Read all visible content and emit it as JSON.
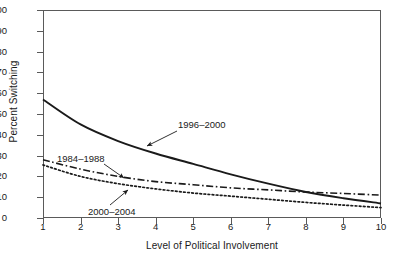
{
  "chart_data": {
    "type": "line",
    "title": "",
    "xlabel": "Level of Political Involvement",
    "ylabel": "Percent Switching",
    "xlim": [
      1,
      10
    ],
    "ylim": [
      0,
      100
    ],
    "xticks": [
      "1",
      "2",
      "3",
      "4",
      "5",
      "6",
      "7",
      "8",
      "9",
      "10"
    ],
    "yticks": [
      "0",
      "10",
      "20",
      "30",
      "40",
      "50",
      "60",
      "70",
      "80",
      "90",
      "100"
    ],
    "grid": false,
    "legend_position": "inline-annotations",
    "x": [
      1,
      2,
      3,
      4,
      5,
      6,
      7,
      8,
      9,
      10
    ],
    "series": [
      {
        "name": "1996-2000",
        "label": "1996–2000",
        "style": "solid",
        "color": "#1a1a1a",
        "values": [
          57,
          45,
          37,
          31,
          26,
          21,
          16.5,
          12.5,
          9.5,
          7
        ]
      },
      {
        "name": "1984-1988",
        "label": "1984–1988",
        "style": "dash-dot",
        "color": "#1a1a1a",
        "values": [
          28,
          23.5,
          20,
          17.5,
          16,
          14.5,
          13.5,
          12.5,
          11.8,
          11
        ]
      },
      {
        "name": "2000-2004",
        "label": "2000–2004",
        "style": "dotted",
        "color": "#1a1a1a",
        "values": [
          25.5,
          20,
          16.5,
          14,
          12,
          10.5,
          9,
          7.5,
          6.2,
          5
        ]
      }
    ],
    "annotations": [
      {
        "name": "1996-2000",
        "text": "1996–2000",
        "points_to_series": "1996-2000"
      },
      {
        "name": "1984-1988",
        "text": "1984–1988",
        "points_to_series": "1984-1988"
      },
      {
        "name": "2000-2004",
        "text": "2000–2004",
        "points_to_series": "2000-2004"
      }
    ]
  },
  "axes": {
    "ylabel": "Percent Switching",
    "xlabel": "Level of Political Involvement",
    "yticks": [
      "100",
      "90",
      "80",
      "70",
      "60",
      "50",
      "40",
      "30",
      "20",
      "10",
      "0"
    ],
    "xticks": [
      "1",
      "2",
      "3",
      "4",
      "5",
      "6",
      "7",
      "8",
      "9",
      "10"
    ]
  },
  "annotations": {
    "s1996": "1996–2000",
    "s1984": "1984–1988",
    "s2000": "2000–2004"
  }
}
